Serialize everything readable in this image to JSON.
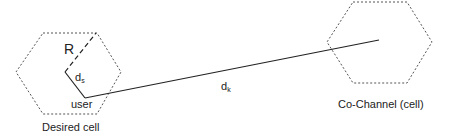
{
  "diagram": {
    "desired_cell": {
      "caption": "Desired cell",
      "radius_label": "R",
      "user_label": "user",
      "ds_label": "d",
      "ds_sub": "s"
    },
    "cochannel_cell": {
      "caption": "Co-Channel (cell)"
    },
    "link": {
      "dk_label": "d",
      "dk_sub": "k"
    },
    "colors": {
      "stroke": "#222222",
      "hex_dash": "#555555",
      "background": "#ffffff"
    }
  }
}
